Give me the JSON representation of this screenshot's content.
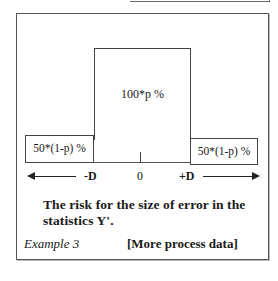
{
  "figure": {
    "center_label": "100*p %",
    "left_label": "50*(1-p) %",
    "right_label": "50*(1-p) %",
    "axis": {
      "minus": "-D",
      "zero": "0",
      "plus": "+D"
    },
    "caption": "The risk for the size of error in the statistics Y'.",
    "example_label": "Example 3",
    "link_label": "[More process data]"
  }
}
